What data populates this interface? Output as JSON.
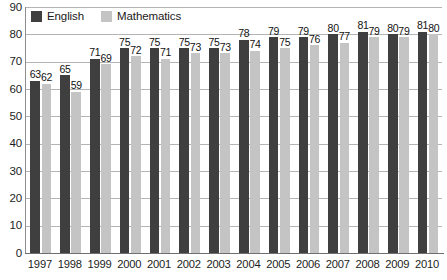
{
  "chart_data": {
    "type": "bar",
    "title": "",
    "xlabel": "",
    "ylabel": "",
    "ylim": [
      0,
      90
    ],
    "ytick_step": 10,
    "grid": true,
    "legend_position": "top-left",
    "categories": [
      "1997",
      "1998",
      "1999",
      "2000",
      "2001",
      "2002",
      "2003",
      "2004",
      "2005",
      "2006",
      "2007",
      "2008",
      "2009",
      "2010"
    ],
    "yticks": [
      "90",
      "80",
      "70",
      "60",
      "50",
      "40",
      "30",
      "20",
      "10",
      "0"
    ],
    "series": [
      {
        "name": "English",
        "color": "#3f3f3f",
        "values": [
          63,
          65,
          71,
          75,
          75,
          75,
          75,
          78,
          79,
          79,
          80,
          81,
          80,
          81
        ]
      },
      {
        "name": "Mathematics",
        "color": "#c4c4c4",
        "values": [
          62,
          59,
          69,
          72,
          71,
          73,
          73,
          74,
          75,
          76,
          77,
          79,
          79,
          80
        ]
      }
    ]
  },
  "legend": {
    "items": [
      {
        "label": "English",
        "swatch": "legend-swatch-english"
      },
      {
        "label": "Mathematics",
        "swatch": "legend-swatch-mathematics"
      }
    ]
  },
  "colors": {
    "english": "#3f3f3f",
    "mathematics": "#c4c4c4",
    "gridline": "#b4b4b4",
    "axis": "#6f6f6f",
    "text": "#1d1d1d",
    "background": "#ffffff"
  }
}
